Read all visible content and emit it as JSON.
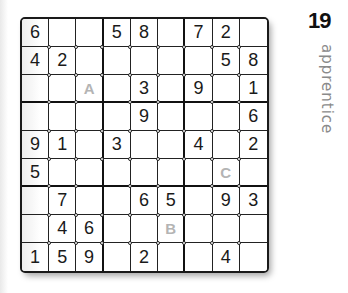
{
  "puzzle": {
    "number": "19",
    "difficulty": "apprentice",
    "grid": [
      [
        "6",
        "",
        "",
        "5",
        "8",
        "",
        "7",
        "2",
        ""
      ],
      [
        "4",
        "2",
        "",
        "",
        "",
        "",
        "",
        "5",
        "8"
      ],
      [
        "",
        "",
        "",
        "",
        "3",
        "",
        "9",
        "",
        "1"
      ],
      [
        "",
        "",
        "",
        "",
        "9",
        "",
        "",
        "",
        "6"
      ],
      [
        "9",
        "1",
        "",
        "3",
        "",
        "",
        "4",
        "",
        "2"
      ],
      [
        "5",
        "",
        "",
        "",
        "",
        "",
        "",
        "",
        ""
      ],
      [
        "",
        "7",
        "",
        "",
        "6",
        "5",
        "",
        "9",
        "3"
      ],
      [
        "",
        "4",
        "6",
        "",
        "",
        "",
        "",
        "",
        ""
      ],
      [
        "1",
        "5",
        "9",
        "",
        "2",
        "",
        "",
        "4",
        ""
      ]
    ],
    "markers": [
      {
        "label": "A",
        "row": 2,
        "col": 2
      },
      {
        "label": "B",
        "row": 7,
        "col": 5
      },
      {
        "label": "C",
        "row": 5,
        "col": 7
      }
    ]
  }
}
